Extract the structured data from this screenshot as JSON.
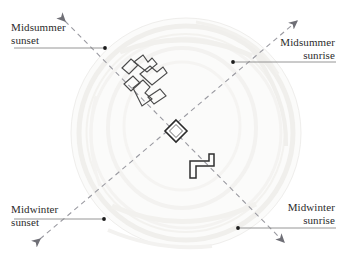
{
  "figure": {
    "kind": "archaeoastronomy-alignment-plan",
    "background_color": "#ffffff",
    "axis_color": "#8c8c94",
    "leader_color": "#8a8a8a",
    "stone_color": "#3a3a3a",
    "monument_color": "#f2f1ee",
    "text_color": "#2b2b2b"
  },
  "labels": {
    "midsummer_sunset": "Midsummer\nsunset",
    "midsummer_sunrise": "Midsummer\nsunrise",
    "midwinter_sunset": "Midwinter\nsunset",
    "midwinter_sunrise": "Midwinter\nsunrise"
  },
  "axes": [
    {
      "name": "midsummer-sunrise-midwinter-sunset-axis",
      "from_label": "Midwinter sunset",
      "to_label": "Midsummer sunrise",
      "x1": 36,
      "y1": 243,
      "x2": 300,
      "y2": 18,
      "style": "dashed",
      "arrow_start": true,
      "arrow_end": true
    },
    {
      "name": "midsummer-sunset-midwinter-sunrise-axis",
      "from_label": "Midsummer sunset",
      "to_label": "Midwinter sunrise",
      "x1": 62,
      "y1": 18,
      "x2": 287,
      "y2": 245,
      "style": "dashed",
      "arrow_start": true,
      "arrow_end": true
    }
  ],
  "leaders": [
    {
      "name": "leader-midsummer-sunset",
      "x1": 14,
      "y1": 48,
      "x2": 105,
      "y2": 48,
      "dot_x": 105,
      "dot_y": 48
    },
    {
      "name": "leader-midsummer-sunrise",
      "x1": 335,
      "y1": 62,
      "x2": 233,
      "y2": 62,
      "dot_x": 233,
      "dot_y": 62
    },
    {
      "name": "leader-midwinter-sunset",
      "x1": 14,
      "y1": 219,
      "x2": 104,
      "y2": 219,
      "dot_x": 104,
      "dot_y": 219
    },
    {
      "name": "leader-midwinter-sunrise",
      "x1": 335,
      "y1": 228,
      "x2": 238,
      "y2": 228,
      "dot_x": 238,
      "dot_y": 228
    }
  ],
  "stones": {
    "central_stone": {
      "name": "central-diamond-stone",
      "cx": 176,
      "cy": 131,
      "size": 11
    },
    "northwest_cluster_count": 6,
    "southeast_bracket_count": 1
  }
}
